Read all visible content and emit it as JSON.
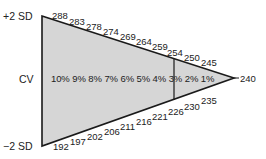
{
  "diagram": {
    "labels": {
      "top": "+2 SD",
      "middle": "CV",
      "bottom": "−2 SD"
    },
    "apex_value": "240",
    "upper_edge_values": [
      "288",
      "283",
      "278",
      "274",
      "269",
      "264",
      "259",
      "254",
      "250",
      "245"
    ],
    "lower_edge_values": [
      "192",
      "197",
      "202",
      "206",
      "211",
      "216",
      "221",
      "226",
      "230",
      "235"
    ],
    "cv_row": "10% 9% 8% 7% 6% 5% 4% 3% 2% 1%",
    "colors": {
      "fill": "#d6d6d6",
      "stroke": "#1a1a1a"
    }
  }
}
